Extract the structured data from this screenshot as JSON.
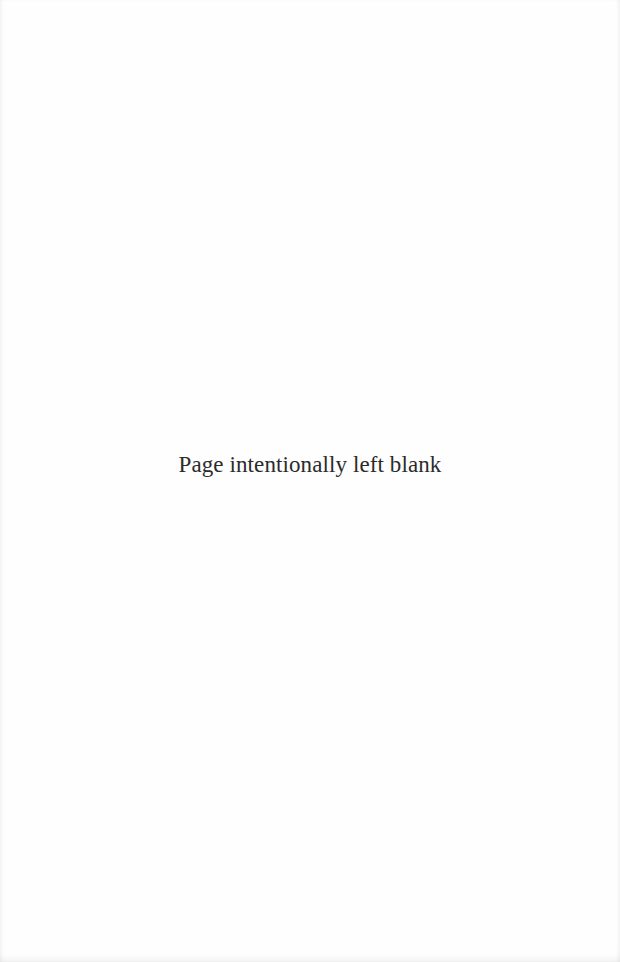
{
  "page": {
    "notice_text": "Page intentionally left blank"
  }
}
